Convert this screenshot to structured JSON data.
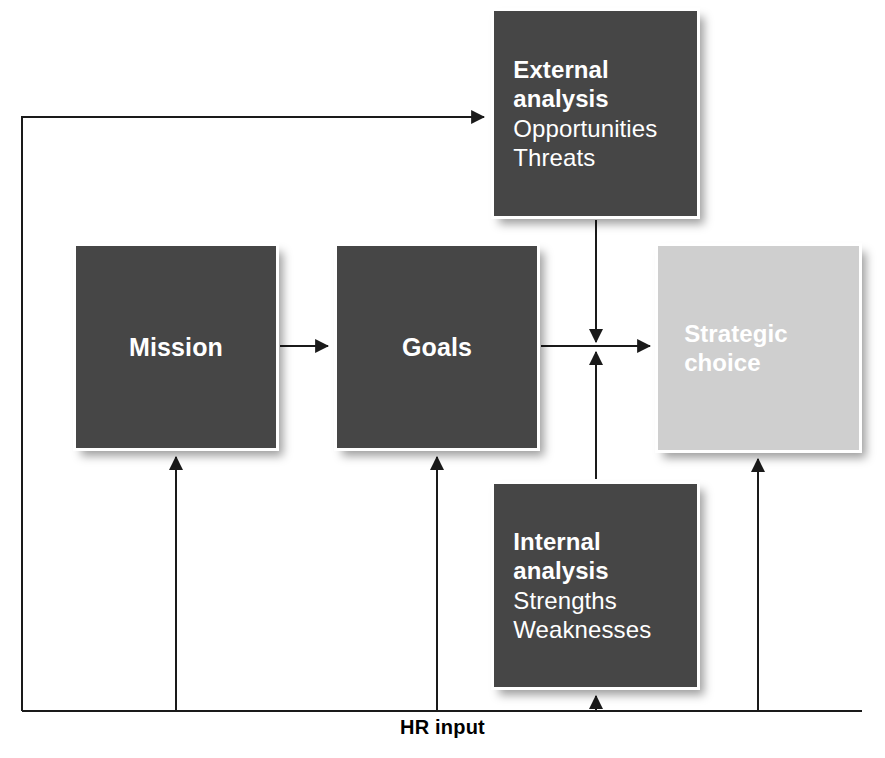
{
  "diagram": {
    "caption": "HR input",
    "colors": {
      "dark_box": "#464646",
      "light_box": "#cfcfcf",
      "box_text": "#ffffff",
      "connector": "#1a1a1a",
      "background": "#ffffff",
      "caption_text": "#000000"
    },
    "nodes": [
      {
        "id": "external-analysis",
        "style": "dark",
        "lines": [
          {
            "text": "External",
            "weight": "bold"
          },
          {
            "text": "analysis",
            "weight": "bold"
          },
          {
            "text": "Opportunities",
            "weight": "regular"
          },
          {
            "text": "Threats",
            "weight": "regular"
          }
        ]
      },
      {
        "id": "mission",
        "style": "dark",
        "lines": [
          {
            "text": "Mission",
            "weight": "bold"
          }
        ]
      },
      {
        "id": "goals",
        "style": "dark",
        "lines": [
          {
            "text": "Goals",
            "weight": "bold"
          }
        ]
      },
      {
        "id": "strategic-choice",
        "style": "light",
        "lines": [
          {
            "text": "Strategic",
            "weight": "bold"
          },
          {
            "text": "choice",
            "weight": "bold"
          }
        ]
      },
      {
        "id": "internal-analysis",
        "style": "dark",
        "lines": [
          {
            "text": "Internal",
            "weight": "bold"
          },
          {
            "text": "analysis",
            "weight": "bold"
          },
          {
            "text": "Strengths",
            "weight": "regular"
          },
          {
            "text": "Weaknesses",
            "weight": "regular"
          }
        ]
      }
    ],
    "connections": [
      {
        "from": "hr-input-bus",
        "to": "external-analysis",
        "arrow": true
      },
      {
        "from": "mission",
        "to": "goals",
        "arrow": true
      },
      {
        "from": "external-analysis",
        "to": "junction",
        "arrow": true
      },
      {
        "from": "internal-analysis",
        "to": "junction",
        "arrow": true
      },
      {
        "from": "junction",
        "to": "strategic-choice",
        "arrow": true
      },
      {
        "from": "hr-input-bus",
        "to": "mission",
        "arrow": true
      },
      {
        "from": "hr-input-bus",
        "to": "goals",
        "arrow": true
      },
      {
        "from": "hr-input-bus",
        "to": "internal-analysis",
        "arrow": true
      },
      {
        "from": "strategic-choice",
        "to": "hr-input-bus",
        "arrow": true
      }
    ]
  }
}
